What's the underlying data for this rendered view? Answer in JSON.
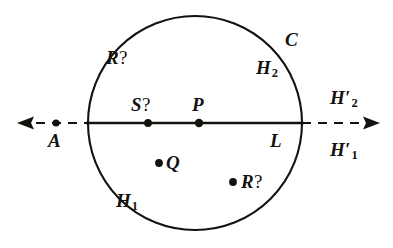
{
  "figure": {
    "type": "geometry-diagram",
    "background_color": "#ffffff",
    "ink_color": "#14120f",
    "circle": {
      "name": "C",
      "center_x": 195,
      "center_y": 123,
      "radius": 107,
      "stroke_width": 2.1
    },
    "line": {
      "name": "L",
      "y": 123,
      "solid_from_x": 88,
      "solid_to_x": 302,
      "dash_left_from_x": 36,
      "dash_left_to_x": 88,
      "dash_right_from_x": 302,
      "dash_right_to_x": 366,
      "arrow_left_tip_x": 17,
      "arrow_right_tip_x": 380,
      "stroke_width": 2.1,
      "dash_pattern": "9 7"
    },
    "points": [
      {
        "id": "A",
        "label": "A",
        "x": 56,
        "y": 123,
        "radius": 3.6,
        "label_dx": -8,
        "label_dy": 20
      },
      {
        "id": "S",
        "label": "S?",
        "x": 148,
        "y": 123,
        "radius": 3.9,
        "label_dx": -17,
        "label_dy": -12
      },
      {
        "id": "P",
        "label": "P",
        "x": 199,
        "y": 123,
        "radius": 4.2,
        "label_dx": -7,
        "label_dy": -12
      },
      {
        "id": "Q",
        "label": "Q",
        "x": 159,
        "y": 163,
        "radius": 3.9,
        "label_dx": 7,
        "label_dy": 5
      },
      {
        "id": "R",
        "label": "R?",
        "x": 233,
        "y": 182,
        "radius": 3.9,
        "label_dx": 8,
        "label_dy": 5
      }
    ],
    "labels": [
      {
        "id": "label-R-top",
        "base": "R",
        "suffix": "?",
        "kind": "question",
        "x": 106,
        "top": 48,
        "note": "upper-left interior"
      },
      {
        "id": "label-C",
        "base": "C",
        "suffix": "",
        "kind": "plain",
        "x": 285,
        "top": 30,
        "note": "circle name, outside upper-right"
      },
      {
        "id": "label-H2",
        "base": "H",
        "suffix": "2",
        "kind": "subscript",
        "x": 256,
        "top": 58,
        "note": "upper half-plane interior"
      },
      {
        "id": "label-S",
        "base": "S",
        "suffix": "?",
        "kind": "question",
        "x": 131,
        "top": 95,
        "note": "above line, left of P"
      },
      {
        "id": "label-P",
        "base": "P",
        "suffix": "",
        "kind": "plain",
        "x": 192,
        "top": 95,
        "note": "above line, center"
      },
      {
        "id": "label-H2prime",
        "base": "H",
        "suffix": "2",
        "kind": "subscript-prime",
        "x": 330,
        "top": 88,
        "note": "above right ray"
      },
      {
        "id": "label-A",
        "base": "A",
        "suffix": "",
        "kind": "plain",
        "x": 48,
        "top": 131,
        "note": "below left ray point"
      },
      {
        "id": "label-L",
        "base": "L",
        "suffix": "",
        "kind": "plain",
        "x": 270,
        "top": 131,
        "note": "line name, below line inside circle"
      },
      {
        "id": "label-H1prime",
        "base": "H",
        "suffix": "1",
        "kind": "subscript-prime",
        "x": 330,
        "top": 140,
        "note": "below right ray"
      },
      {
        "id": "label-Q",
        "base": "Q",
        "suffix": "",
        "kind": "plain",
        "x": 166,
        "top": 153,
        "note": "lower interior, right of its dot"
      },
      {
        "id": "label-R-bot",
        "base": "R",
        "suffix": "?",
        "kind": "question",
        "x": 241,
        "top": 172,
        "note": "lower-right interior, right of its dot"
      },
      {
        "id": "label-H1",
        "base": "H",
        "suffix": "1",
        "kind": "subscript",
        "x": 116,
        "top": 191,
        "note": "lower half-plane interior"
      }
    ],
    "text": {
      "R_top": "R",
      "R_top_q": "?",
      "C": "C",
      "H": "H",
      "sub_1": "1",
      "sub_2": "2",
      "prime": "′",
      "S": "S",
      "S_q": "?",
      "P": "P",
      "A": "A",
      "L": "L",
      "Q": "Q",
      "R_bot": "R",
      "R_bot_q": "?",
      "dot": "•"
    }
  }
}
